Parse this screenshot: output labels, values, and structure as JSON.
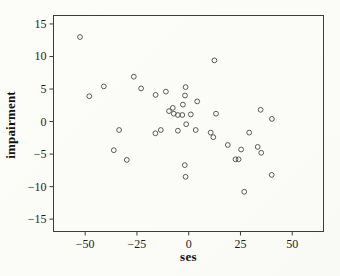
{
  "figure": {
    "background": "#fcfcfa",
    "frame_color": "#3c3c3c",
    "tick_color": "#3c3c3c",
    "marker_color": "#4a4a4a",
    "label_color": "#1d1d1d"
  },
  "chart_data": {
    "type": "scatter",
    "title": "",
    "xlabel": "ses",
    "ylabel": "impairment",
    "marker": "open-circle",
    "grid": false,
    "legend": "none",
    "xlim": [
      -65.3,
      65.1
    ],
    "ylim": [
      -16.9,
      16.3
    ],
    "x_ticks": [
      {
        "value": -50,
        "label": "−50"
      },
      {
        "value": -25,
        "label": "−25"
      },
      {
        "value": 0,
        "label": "0"
      },
      {
        "value": 25,
        "label": "25"
      },
      {
        "value": 50,
        "label": "50"
      }
    ],
    "y_ticks": [
      {
        "value": -15,
        "label": "−15"
      },
      {
        "value": -10,
        "label": "−10"
      },
      {
        "value": -5,
        "label": "−5"
      },
      {
        "value": 0,
        "label": "0"
      },
      {
        "value": 5,
        "label": "5"
      },
      {
        "value": 10,
        "label": "10"
      },
      {
        "value": 15,
        "label": "15"
      }
    ],
    "points": [
      [
        -52.5,
        13.0
      ],
      [
        -48.0,
        3.9
      ],
      [
        -41.0,
        5.4
      ],
      [
        -36.2,
        -4.4
      ],
      [
        -33.6,
        -1.3
      ],
      [
        -29.9,
        -5.9
      ],
      [
        -26.5,
        6.9
      ],
      [
        -23.0,
        5.1
      ],
      [
        -16.0,
        4.1
      ],
      [
        -16.1,
        -1.8
      ],
      [
        -13.5,
        -1.3
      ],
      [
        -11.0,
        4.6
      ],
      [
        -9.5,
        1.6
      ],
      [
        -7.7,
        2.1
      ],
      [
        -7.2,
        1.2
      ],
      [
        -5.2,
        1.0
      ],
      [
        -3.1,
        1.0
      ],
      [
        -5.2,
        -1.4
      ],
      [
        -1.2,
        -0.4
      ],
      [
        3.4,
        -1.3
      ],
      [
        -2.8,
        2.6
      ],
      [
        -1.8,
        4.0
      ],
      [
        -1.5,
        5.3
      ],
      [
        4.1,
        3.1
      ],
      [
        1.0,
        1.1
      ],
      [
        12.4,
        9.4
      ],
      [
        13.2,
        1.2
      ],
      [
        -1.9,
        -6.7
      ],
      [
        -1.5,
        -8.5
      ],
      [
        34.7,
        1.8
      ],
      [
        40.2,
        0.4
      ],
      [
        10.6,
        -1.7
      ],
      [
        11.9,
        -2.4
      ],
      [
        18.9,
        -3.6
      ],
      [
        22.6,
        -5.8
      ],
      [
        24.1,
        -5.8
      ],
      [
        25.3,
        -4.3
      ],
      [
        29.2,
        -1.7
      ],
      [
        33.3,
        -3.9
      ],
      [
        35.0,
        -4.8
      ],
      [
        40.1,
        -8.2
      ],
      [
        26.8,
        -10.8
      ]
    ]
  }
}
